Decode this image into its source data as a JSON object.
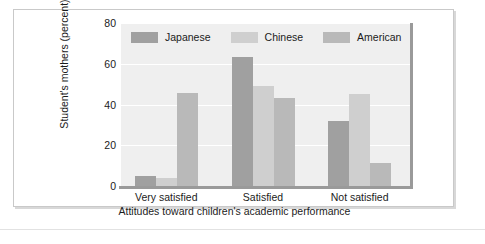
{
  "chart_data": {
    "type": "bar",
    "title": "",
    "xlabel": "Attitudes toward children's academic performance",
    "ylabel": "Student's mothers (percent)",
    "categories": [
      "Very satisfied",
      "Satisfied",
      "Not satisfied"
    ],
    "series": [
      {
        "name": "Japanese",
        "color": "#a0a0a0",
        "values": [
          5,
          63.5,
          32
        ]
      },
      {
        "name": "Chinese",
        "color": "#cfcfcf",
        "values": [
          4,
          49,
          45
        ]
      },
      {
        "name": "American",
        "color": "#b9b9b9",
        "values": [
          45.5,
          43,
          11.5
        ]
      }
    ],
    "ylim": [
      0,
      80
    ],
    "yticks": [
      0,
      20,
      40,
      60,
      80
    ],
    "ytick_labels": [
      "0",
      "20",
      "40",
      "60",
      "80"
    ],
    "grid": true,
    "legend_position": "top-left-inside",
    "plot_background": "#efefef",
    "gridline_color": "#ffffff",
    "axis_color": "#9a9a9a",
    "text_color": "#1b1b1b",
    "frame_color": "#c9c9c9"
  }
}
